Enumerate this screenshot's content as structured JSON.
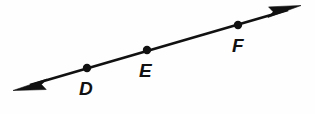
{
  "figure": {
    "kind": "geometry-line-diagram",
    "width": 315,
    "height": 114,
    "background_color": "#fefefe",
    "stroke_color": "#111111",
    "line": {
      "start_x": 13,
      "start_y": 90,
      "end_x": 301,
      "end_y": 6,
      "stroke_width": 2.6,
      "arrow_start": true,
      "arrow_end": true
    },
    "points": [
      {
        "id": "point-d",
        "label": "D",
        "dot_x": 87,
        "dot_y": 68,
        "dot_radius": 4.2,
        "label_x": 79,
        "label_y": 79
      },
      {
        "id": "point-e",
        "label": "E",
        "dot_x": 147,
        "dot_y": 50,
        "dot_radius": 4.2,
        "label_x": 139,
        "label_y": 61
      },
      {
        "id": "point-f",
        "label": "F",
        "dot_x": 238,
        "dot_y": 25,
        "dot_radius": 4.2,
        "label_x": 232,
        "label_y": 36
      }
    ]
  }
}
